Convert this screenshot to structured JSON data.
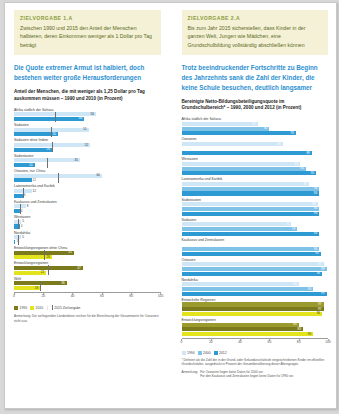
{
  "left": {
    "banner": {
      "kicker": "ZIELVORGABE 1.A",
      "text": "Zwischen 1990 und 2015 den Anteil der Menschen halbieren, deren Einkommen weniger als 1 Dollar pro Tag beträgt"
    },
    "headline": "Die Quote extremer Armut ist halbiert, doch bestehen weiter große Herausforderungen",
    "subhead": "Anteil der Menschen, die mit weniger als 1,25 Dollar pro Tag auskommen müssen – 1990 und 2010 (in Prozent)",
    "axis": {
      "ticks": [
        "0",
        "20",
        "40",
        "60",
        "80",
        "100"
      ],
      "max": 100
    },
    "legend": [
      {
        "label": "1990",
        "color": "#7b7b1e"
      },
      {
        "label": "2010",
        "color": "#e3e31e"
      }
    ],
    "legend_marker": "2015 Zielvorgabe",
    "note": "Anmerkung: Die vorliegenden Länderdaten reichen für die Berechnung der Gesamtwerte für Ozeanien nicht aus.",
    "groups": [
      {
        "label": "Afrika südlich der Sahara",
        "v1990": 56,
        "v2010": 48,
        "target": 28
      },
      {
        "label": "Südasien",
        "v1990": 51,
        "v2010": 30,
        "target": 25.5
      },
      {
        "label": "Südasien ohne Indien",
        "v1990": 52,
        "v2010": 26,
        "target": 26
      },
      {
        "label": "Südostasien",
        "v1990": 45,
        "v2010": 14,
        "target": 22.5
      },
      {
        "label": "Ostasien, nur China",
        "v1990": 60,
        "v2010": 12,
        "target": 30
      },
      {
        "label": "Lateinamerika und Karibik",
        "v1990": 12,
        "v2010": 6,
        "target": 6
      },
      {
        "label": "Kaukasus und Zentralasien",
        "v1990": 8,
        "v2010": 4,
        "target": 4
      },
      {
        "label": "Westasien",
        "v1990": 5,
        "v2010": 4,
        "target": 2.5
      },
      {
        "label": "Nordafrika",
        "v1990": 5,
        "v2010": 1,
        "target": 2.5
      },
      {
        "label": "Entwicklungsregionen ohne China",
        "v1990": 41,
        "v2010": 26,
        "target": 20.5
      },
      {
        "label": "Entwicklungsregionen",
        "v1990": 47,
        "v2010": 22,
        "target": 23.5
      },
      {
        "label": "Welt",
        "v1990": 36,
        "v2010": 18,
        "target": 18
      }
    ]
  },
  "right": {
    "banner": {
      "kicker": "ZIELVORGABE 2.A",
      "text": "Bis zum Jahr 2015 sicherstellen, dass Kinder in der ganzen Welt, Jungen wie Mädchen, eine Grundschulbildung vollständig abschließen können"
    },
    "headline": "Trotz beeindruckender Fortschritte zu Beginn des Jahrzehnts sank die Zahl der Kinder, die keine Schule besuchen, deutlich langsamer",
    "subhead": "Bereinigte Netto-Bildungsbeteiligungsquote im Grundschulbereich* – 1990, 2000 und 2012 (in Prozent)",
    "axis": {
      "ticks": [
        "0",
        "20",
        "40",
        "60",
        "80",
        "100"
      ],
      "max": 100
    },
    "legend": [
      {
        "label": "1990",
        "color": "#2e9ad4"
      },
      {
        "label": "2000",
        "color": "#2e9ad4"
      },
      {
        "label": "2012",
        "color": "#2e9ad4"
      }
    ],
    "footnote": "* Definiert als die Zahl der in der Grund- oder Sekundarschulstufe eingeschriebenen Kinder im offiziellen Grundschulalter, ausgedrückt in Prozent der Gesamtbevölkerung dieser Altersgruppe.",
    "note_label": "Anmerkung:",
    "note_lines": [
      "Für Ozeanien liegen keine Daten für 2000 vor.",
      "Für den Kaukasus und Zentralasien liegen keine Daten für 1990 vor."
    ],
    "groups": [
      {
        "label": "Afrika südlich der Sahara",
        "v1990": 52,
        "v2000": 60,
        "v2012": 78
      },
      {
        "label": "Ozeanien",
        "v1990": 69,
        "v2000": 0,
        "v2012": 89
      },
      {
        "label": "Westasien",
        "v1990": 81,
        "v2000": 85,
        "v2012": 92
      },
      {
        "label": "Lateinamerika und Karibik",
        "v1990": 87,
        "v2000": 94,
        "v2012": 94
      },
      {
        "label": "Südostasien",
        "v1990": 93,
        "v2000": 94,
        "v2012": 94
      },
      {
        "label": "Südasien",
        "v1990": 75,
        "v2000": 79,
        "v2012": 94
      },
      {
        "label": "Kaukasus und Zentralasien",
        "v1990": 0,
        "v2000": 94,
        "v2012": 95
      },
      {
        "label": "Ostasien",
        "v1990": 97,
        "v2000": 99,
        "v2012": 96
      },
      {
        "label": "Nordafrika",
        "v1990": 80,
        "v2000": 90,
        "v2012": 99
      },
      {
        "label": "Entwickelte Regionen",
        "v1990": 97,
        "v2000": 97,
        "v2012": 96
      },
      {
        "label": "Entwicklungsregionen",
        "v1990": 80,
        "v2000": 83,
        "v2012": 90
      }
    ]
  }
}
